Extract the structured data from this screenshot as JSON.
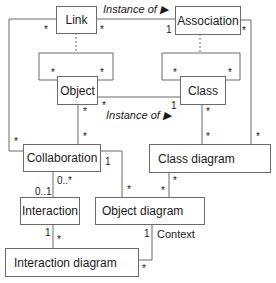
{
  "diagram": {
    "type": "UML metamodel class diagram",
    "nodes": {
      "link": "Link",
      "association": "Association",
      "object": "Object",
      "class": "Class",
      "collaboration": "Collaboration",
      "class_diagram": "Class diagram",
      "interaction": "Interaction",
      "object_diagram": "Object diagram",
      "interaction_diagram": "Interaction diagram"
    },
    "labels": {
      "instance_of_top": "Instance of ▶",
      "instance_of_mid": "Instance of ▶",
      "context": "Context"
    },
    "multiplicities": {
      "link_left": "*",
      "link_right": "*",
      "assoc_left": "1",
      "assoc_right": "*",
      "object_loop_left": "*",
      "object_loop_right": "*",
      "class_loop_left": "*",
      "class_loop_right": "*",
      "object_instance": "*",
      "class_instance": "1",
      "object_down": "*",
      "collab_up": "*",
      "collab_left": "*",
      "class_down": "*",
      "classdiag_up": "*",
      "classdiag_right": "*",
      "collab_right": "1",
      "objdiag_left": "*",
      "classdiag_down": "*",
      "objdiag_right": "*",
      "collab_down": "0..*",
      "interaction_up": "0..1",
      "interaction_down": "1",
      "intdiag_up": "*",
      "objdiag_context": "1",
      "intdiag_right": "*"
    },
    "edges": [
      {
        "from": "Link",
        "to": "Association",
        "label": "Instance of",
        "from_mult": "*",
        "to_mult": "1"
      },
      {
        "from": "Link",
        "to": "Association",
        "style": "dashed association-class"
      },
      {
        "from": "Object",
        "to": "Object",
        "style": "self-association",
        "mult": [
          "*",
          "*"
        ]
      },
      {
        "from": "Class",
        "to": "Class",
        "style": "self-association",
        "mult": [
          "*",
          "*"
        ]
      },
      {
        "from": "Object",
        "to": "Class",
        "label": "Instance of",
        "from_mult": "*",
        "to_mult": "1"
      },
      {
        "from": "Object",
        "to": "Collaboration",
        "from_mult": "*",
        "to_mult": "*"
      },
      {
        "from": "Link",
        "to": "Collaboration",
        "from_mult": "*",
        "to_mult": "*"
      },
      {
        "from": "Class",
        "to": "Class diagram",
        "from_mult": "*",
        "to_mult": "*"
      },
      {
        "from": "Association",
        "to": "Class diagram",
        "from_mult": "*",
        "to_mult": "*"
      },
      {
        "from": "Collaboration",
        "to": "Object diagram",
        "from_mult": "1",
        "to_mult": "*"
      },
      {
        "from": "Class diagram",
        "to": "Object diagram",
        "from_mult": "*",
        "to_mult": "*"
      },
      {
        "from": "Collaboration",
        "to": "Interaction",
        "from_mult": "0..*",
        "to_mult": "0..1"
      },
      {
        "from": "Interaction",
        "to": "Interaction diagram",
        "from_mult": "1",
        "to_mult": "*"
      },
      {
        "from": "Object diagram",
        "to": "Interaction diagram",
        "label": "Context",
        "from_mult": "1",
        "to_mult": "*"
      }
    ]
  },
  "colors": {
    "line": "#6b6b6b",
    "text": "#1a1a1a",
    "background": "#ffffff"
  }
}
